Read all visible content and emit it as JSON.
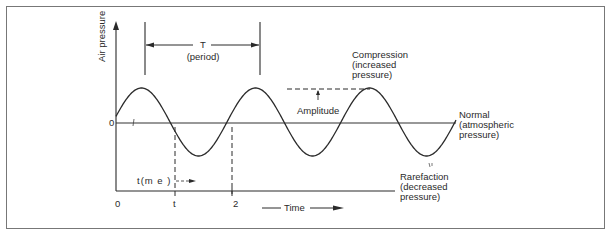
{
  "diagram": {
    "y_axis_label": "Air pressure",
    "zero_label": "0",
    "period": {
      "symbol": "T",
      "label": "(period)"
    },
    "amplitude_label": "Amplitude",
    "compression": {
      "line1": "Compression",
      "line2": "(increased",
      "line3": "pressure)"
    },
    "normal": {
      "line1": "Normal",
      "line2": "(atmospheric",
      "line3": "pressure)"
    },
    "rarefaction": {
      "line1": "Rarefaction",
      "line2": "(decreased",
      "line3": "pressure)"
    },
    "time_marker_label": "t(m e )",
    "x_ticks": [
      "0",
      "t",
      "2"
    ],
    "x_axis_label": "Time",
    "colors": {
      "line": "#2a2a2a",
      "border": "#777777",
      "background": "#ffffff"
    }
  },
  "chart_data": {
    "type": "line",
    "title": "",
    "xlabel": "Time",
    "ylabel": "Air pressure",
    "series": [
      {
        "name": "Sound wave (air pressure)",
        "form": "sine",
        "cycles": 3,
        "amplitude_label": "Amplitude",
        "period_label": "T (period)"
      }
    ],
    "x_tick_labels": [
      "0",
      "t",
      "2"
    ],
    "y_tick_labels": [
      "0"
    ],
    "annotations": [
      "Compression (increased pressure)",
      "Normal (atmospheric pressure)",
      "Rarefaction (decreased pressure)",
      "Amplitude",
      "T (period)"
    ],
    "grid": false
  }
}
